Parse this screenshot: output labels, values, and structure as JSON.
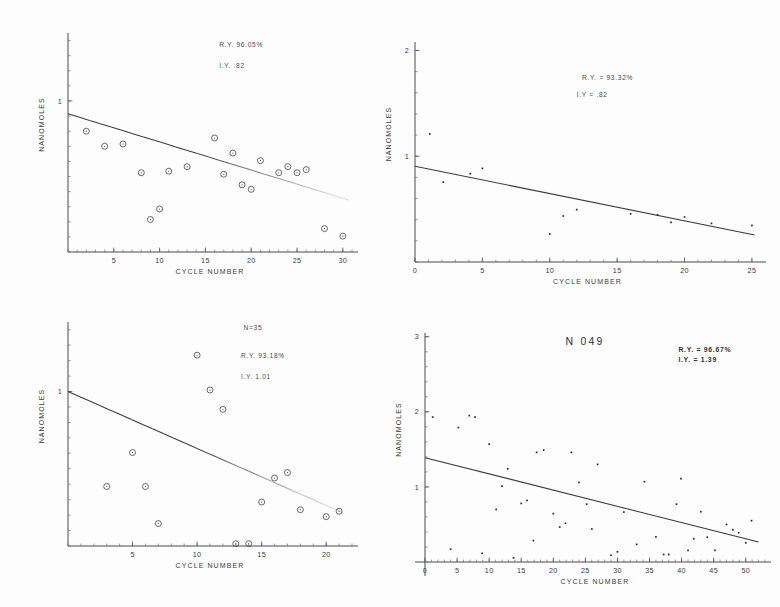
{
  "figure": {
    "background": "#fdfdfd",
    "ink": "#3a3a3a",
    "panel_count": 4
  },
  "chart_data": [
    {
      "id": "top-left",
      "type": "scatter",
      "title": "",
      "xlabel": "CYCLE NUMBER",
      "ylabel": "NANOMOLES",
      "xlim": [
        0,
        31
      ],
      "ylim": [
        0,
        1.45
      ],
      "xticks": [
        5,
        10,
        15,
        20,
        25,
        30
      ],
      "xtick_labels": [
        "5",
        "10",
        "15",
        "20",
        "25",
        "30"
      ],
      "yticks": [
        1
      ],
      "ytick_labels": [
        "1"
      ],
      "grid": false,
      "legend": "none",
      "marker": "open-circle",
      "annotations": [
        {
          "text": "R.Y. 96.05%",
          "x": 16.5,
          "y": 1.36
        },
        {
          "text": "I.Y. .82",
          "x": 16.5,
          "y": 1.22
        }
      ],
      "fit_line": {
        "x0": 0,
        "y0": 0.915,
        "x1": 30.6,
        "y1": 0.345,
        "style": "solid-fading"
      },
      "points": [
        {
          "x": 2,
          "y": 0.8
        },
        {
          "x": 4,
          "y": 0.7
        },
        {
          "x": 6,
          "y": 0.715
        },
        {
          "x": 8,
          "y": 0.525
        },
        {
          "x": 9,
          "y": 0.215
        },
        {
          "x": 10,
          "y": 0.285
        },
        {
          "x": 11,
          "y": 0.535
        },
        {
          "x": 13,
          "y": 0.565
        },
        {
          "x": 16,
          "y": 0.755
        },
        {
          "x": 17,
          "y": 0.515
        },
        {
          "x": 18,
          "y": 0.655
        },
        {
          "x": 19,
          "y": 0.445
        },
        {
          "x": 20,
          "y": 0.415
        },
        {
          "x": 21,
          "y": 0.605
        },
        {
          "x": 23,
          "y": 0.525
        },
        {
          "x": 24,
          "y": 0.565
        },
        {
          "x": 25,
          "y": 0.525
        },
        {
          "x": 26,
          "y": 0.545
        },
        {
          "x": 28,
          "y": 0.155
        },
        {
          "x": 30,
          "y": 0.105
        }
      ]
    },
    {
      "id": "top-right",
      "type": "scatter",
      "title": "",
      "xlabel": "CYCLE NUMBER",
      "ylabel": "NANOMOLES",
      "xlim": [
        0,
        25.6
      ],
      "ylim": [
        0,
        2.08
      ],
      "xticks": [
        0,
        5,
        10,
        15,
        20,
        25
      ],
      "xtick_labels": [
        "0",
        "5",
        "10",
        "15",
        "20",
        "25"
      ],
      "yticks": [
        1,
        2
      ],
      "ytick_labels": [
        "1",
        "2"
      ],
      "grid": false,
      "legend": "none",
      "marker": "dot",
      "annotations": [
        {
          "text": "R.Y. = 93.32%",
          "x": 12.4,
          "y": 1.72
        },
        {
          "text": "I.Y = .82",
          "x": 12.0,
          "y": 1.56
        }
      ],
      "fit_line": {
        "x0": 0,
        "y0": 0.905,
        "x1": 25.2,
        "y1": 0.255,
        "style": "solid"
      },
      "points": [
        {
          "x": 1.1,
          "y": 1.21
        },
        {
          "x": 2.1,
          "y": 0.755
        },
        {
          "x": 4.1,
          "y": 0.835
        },
        {
          "x": 5.0,
          "y": 0.885
        },
        {
          "x": 10.0,
          "y": 0.265
        },
        {
          "x": 11.0,
          "y": 0.435
        },
        {
          "x": 12.0,
          "y": 0.495
        },
        {
          "x": 16.0,
          "y": 0.455
        },
        {
          "x": 18.0,
          "y": 0.445
        },
        {
          "x": 19.0,
          "y": 0.375
        },
        {
          "x": 20.0,
          "y": 0.425
        },
        {
          "x": 22.0,
          "y": 0.365
        },
        {
          "x": 25.0,
          "y": 0.345
        }
      ]
    },
    {
      "id": "bottom-left",
      "type": "scatter",
      "title": "",
      "xlabel": "CYCLE NUMBER",
      "ylabel": "NANOMOLES",
      "xlim": [
        0,
        22
      ],
      "ylim": [
        0,
        1.45
      ],
      "xticks": [
        5,
        10,
        15,
        20
      ],
      "xtick_labels": [
        "5",
        "10",
        "15",
        "20"
      ],
      "yticks": [
        1
      ],
      "ytick_labels": [
        "1"
      ],
      "grid": false,
      "legend": "none",
      "marker": "open-circle",
      "annotations": [
        {
          "text": "N=35",
          "x": 13.6,
          "y": 1.4
        },
        {
          "text": "R.Y. 93.18%",
          "x": 13.4,
          "y": 1.22
        },
        {
          "text": "I.Y. 1.01",
          "x": 13.4,
          "y": 1.08
        }
      ],
      "fit_line": {
        "x0": 0,
        "y0": 1.0,
        "x1": 21.3,
        "y1": 0.215,
        "style": "solid-fading"
      },
      "points": [
        {
          "x": 3,
          "y": 0.385
        },
        {
          "x": 5,
          "y": 0.605
        },
        {
          "x": 6,
          "y": 0.385
        },
        {
          "x": 7,
          "y": 0.145
        },
        {
          "x": 10,
          "y": 1.235
        },
        {
          "x": 11,
          "y": 1.01
        },
        {
          "x": 12,
          "y": 0.885
        },
        {
          "x": 13,
          "y": 0.015
        },
        {
          "x": 14,
          "y": 0.015
        },
        {
          "x": 15,
          "y": 0.285
        },
        {
          "x": 16,
          "y": 0.44
        },
        {
          "x": 17,
          "y": 0.475
        },
        {
          "x": 18,
          "y": 0.235
        },
        {
          "x": 20,
          "y": 0.19
        },
        {
          "x": 21,
          "y": 0.225
        }
      ]
    },
    {
      "id": "bottom-right",
      "type": "scatter",
      "title": "N 049",
      "xlabel": "CYCLE NUMBER",
      "ylabel": "NANOMOLES",
      "xlim": [
        0,
        53
      ],
      "ylim": [
        0,
        3.05
      ],
      "xticks": [
        0,
        5,
        10,
        15,
        20,
        25,
        30,
        35,
        40,
        45,
        50
      ],
      "xtick_labels": [
        "0",
        "5",
        "10",
        "15",
        "20",
        "25",
        "30",
        "35",
        "40",
        "45",
        "50"
      ],
      "yticks": [
        1,
        2,
        3
      ],
      "ytick_labels": [
        "1",
        "2",
        "3"
      ],
      "grid": false,
      "legend": "none",
      "marker": "dot",
      "annotations": [
        {
          "text": "R.Y. = 96.67%",
          "x": 39.5,
          "y": 2.8
        },
        {
          "text": "I.Y. = 1.39",
          "x": 39.5,
          "y": 2.66
        }
      ],
      "fit_line": {
        "x0": 0,
        "y0": 1.39,
        "x1": 52.0,
        "y1": 0.265,
        "style": "solid"
      },
      "points": [
        {
          "x": 1.2,
          "y": 1.93
        },
        {
          "x": 4.0,
          "y": 0.17
        },
        {
          "x": 5.2,
          "y": 1.79
        },
        {
          "x": 6.9,
          "y": 1.95
        },
        {
          "x": 7.8,
          "y": 1.93
        },
        {
          "x": 8.9,
          "y": 0.115
        },
        {
          "x": 10.0,
          "y": 1.57
        },
        {
          "x": 11.1,
          "y": 0.7
        },
        {
          "x": 12.0,
          "y": 1.01
        },
        {
          "x": 12.9,
          "y": 1.24
        },
        {
          "x": 13.8,
          "y": 0.055
        },
        {
          "x": 15.0,
          "y": 0.78
        },
        {
          "x": 15.9,
          "y": 0.82
        },
        {
          "x": 16.9,
          "y": 0.285
        },
        {
          "x": 17.4,
          "y": 1.46
        },
        {
          "x": 18.5,
          "y": 1.49
        },
        {
          "x": 20.0,
          "y": 0.645
        },
        {
          "x": 21.0,
          "y": 0.465
        },
        {
          "x": 21.9,
          "y": 0.515
        },
        {
          "x": 22.8,
          "y": 1.46
        },
        {
          "x": 24.0,
          "y": 1.06
        },
        {
          "x": 25.2,
          "y": 0.77
        },
        {
          "x": 26.0,
          "y": 0.44
        },
        {
          "x": 26.9,
          "y": 1.3
        },
        {
          "x": 29.0,
          "y": 0.09
        },
        {
          "x": 30.0,
          "y": 0.135
        },
        {
          "x": 31.0,
          "y": 0.665
        },
        {
          "x": 33.0,
          "y": 0.235
        },
        {
          "x": 34.2,
          "y": 1.07
        },
        {
          "x": 36.0,
          "y": 0.335
        },
        {
          "x": 37.2,
          "y": 0.1
        },
        {
          "x": 38.0,
          "y": 0.1
        },
        {
          "x": 39.2,
          "y": 0.77
        },
        {
          "x": 39.9,
          "y": 1.11
        },
        {
          "x": 41.0,
          "y": 0.155
        },
        {
          "x": 41.9,
          "y": 0.31
        },
        {
          "x": 43.0,
          "y": 0.67
        },
        {
          "x": 44.0,
          "y": 0.33
        },
        {
          "x": 45.2,
          "y": 0.155
        },
        {
          "x": 47.0,
          "y": 0.5
        },
        {
          "x": 48.0,
          "y": 0.43
        },
        {
          "x": 48.9,
          "y": 0.39
        },
        {
          "x": 50.0,
          "y": 0.255
        },
        {
          "x": 50.9,
          "y": 0.55
        }
      ]
    }
  ]
}
